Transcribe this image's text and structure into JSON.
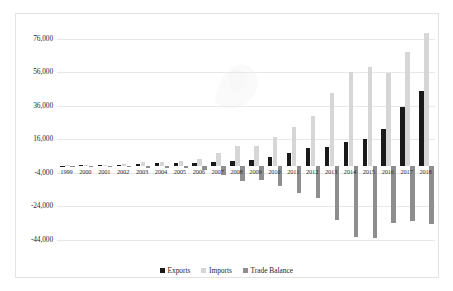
{
  "chart_data": {
    "type": "bar",
    "title": "",
    "subtitle": "",
    "xlabel": "",
    "ylabel": "",
    "grid": true,
    "legend_position": "bottom-center",
    "ylim": [
      -50000,
      86000
    ],
    "y_ticks": [
      76000,
      56000,
      36000,
      16000,
      -4000,
      -24000,
      -44000
    ],
    "y_tick_labels": [
      "76,000",
      "56,000",
      "36,000",
      "16,000",
      "-4,000",
      "-24,000",
      "-44,000"
    ],
    "categories": [
      "1999",
      "2000",
      "2001",
      "2002",
      "2003",
      "2004",
      "2005",
      "2006",
      "2007",
      "2008",
      "2009",
      "2010",
      "2011",
      "2012",
      "2013",
      "2014",
      "2015",
      "2016",
      "2017",
      "2018"
    ],
    "series": [
      {
        "name": "Exports",
        "color": "#1a1a1a",
        "values": [
          300,
          700,
          500,
          900,
          1100,
          1600,
          1900,
          1600,
          2200,
          3200,
          3800,
          5400,
          7600,
          11000,
          11400,
          14300,
          16500,
          22000,
          35500,
          45000
        ]
      },
      {
        "name": "Imports",
        "color": "#d6d6d6",
        "values": [
          500,
          900,
          800,
          1400,
          2300,
          2700,
          2900,
          4100,
          7600,
          11900,
          12300,
          17200,
          23600,
          30100,
          43500,
          56400,
          59200,
          55600,
          68200,
          79300
        ]
      },
      {
        "name": "Trade Balance",
        "color": "#8e8e8e",
        "values": [
          -200,
          -200,
          -300,
          -500,
          -1200,
          -1100,
          -1000,
          -2500,
          -5400,
          -8700,
          -8500,
          -11800,
          -16000,
          -19100,
          -32100,
          -42100,
          -42700,
          -33600,
          -32700,
          -34300
        ]
      }
    ]
  },
  "legend": {
    "items": [
      {
        "label": "Exports",
        "swatch": "exports"
      },
      {
        "label": "Imports",
        "swatch": "imports"
      },
      {
        "label": "Trade Balance",
        "swatch": "balance"
      }
    ]
  }
}
